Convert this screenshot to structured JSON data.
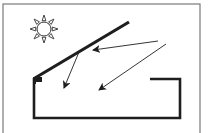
{
  "diagram": {
    "description": "Sun illuminating a house/room with a slanted roof; arrows show light rays reflecting off the roof and entering the room",
    "colors": {
      "background": "#ffffff",
      "frame": "#7a7a7a",
      "stroke": "#1e1e1e",
      "sun_stroke": "#333333"
    },
    "elements": {
      "sun": {
        "icon": "sun-icon",
        "cx": 44,
        "cy": 29,
        "r": 7,
        "rays": 8
      },
      "roof": {
        "x1": 35,
        "y1": 78,
        "x2": 129,
        "y2": 22
      },
      "room": {
        "points": "150,79 180,79 180,118 34,118 34,78"
      },
      "arrows": [
        {
          "name": "ray-arrow-to-roof",
          "x1": 158,
          "y1": 41,
          "x2": 93,
          "y2": 50
        },
        {
          "name": "reflected-ray-arrow",
          "x1": 79,
          "y1": 52,
          "x2": 64,
          "y2": 88
        },
        {
          "name": "ray-arrow-into-room",
          "x1": 166,
          "y1": 44,
          "x2": 99,
          "y2": 90
        }
      ]
    }
  }
}
